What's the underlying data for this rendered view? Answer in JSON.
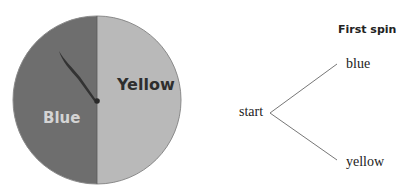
{
  "spinner": {
    "sections": [
      {
        "name": "Blue",
        "label": "Blue",
        "fill": "#6e6e6e",
        "label_color": "#d4d4d4"
      },
      {
        "name": "Yellow",
        "label": "Yellow",
        "fill": "#b9b9b9",
        "label_color": "#2e2e2e"
      }
    ],
    "border_color": "#8a8a8a",
    "pointer_color": "#333333"
  },
  "tree": {
    "header": "First spin",
    "root": "start",
    "branches": [
      "blue",
      "yellow"
    ],
    "line_color": "#777777"
  }
}
